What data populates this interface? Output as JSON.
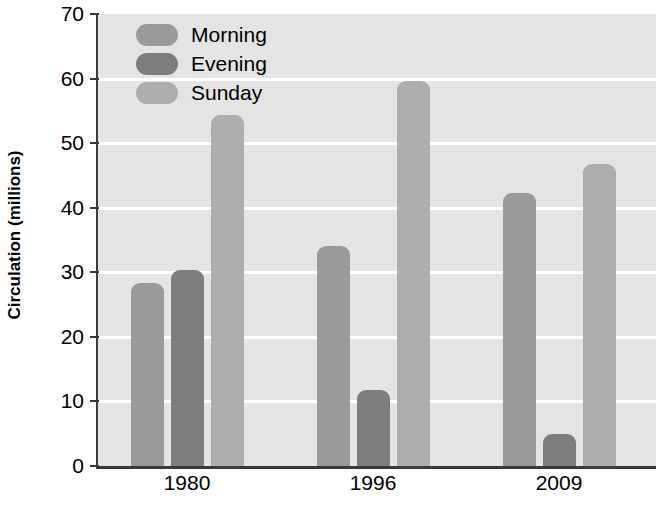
{
  "chart_data": {
    "type": "bar",
    "title": "",
    "xlabel": "",
    "ylabel": "Circulation (millions)",
    "categories": [
      "1980",
      "1996",
      "2009"
    ],
    "series": [
      {
        "name": "Morning",
        "color": "#9a9a9a",
        "values": [
          28.4,
          34.0,
          42.3
        ]
      },
      {
        "name": "Evening",
        "color": "#7d7d7d",
        "values": [
          30.4,
          11.7,
          4.9
        ]
      },
      {
        "name": "Sunday",
        "color": "#adadad",
        "values": [
          54.3,
          59.7,
          46.7
        ]
      }
    ],
    "ylim": [
      0,
      70
    ],
    "yticks": [
      0,
      10,
      20,
      30,
      40,
      50,
      60,
      70
    ],
    "ytick_labels": [
      "0",
      "10",
      "20",
      "30",
      "40",
      "50",
      "60",
      "70"
    ],
    "grid": true,
    "gridline_color": "#ffffff",
    "plot_background": "#e4e4e4",
    "axis_color": "#3a3a3a",
    "legend_position": "top-left"
  },
  "legend": {
    "items": [
      {
        "label": "Morning"
      },
      {
        "label": "Evening"
      },
      {
        "label": "Sunday"
      }
    ]
  }
}
